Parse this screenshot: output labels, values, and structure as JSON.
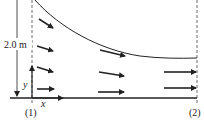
{
  "diagram": {
    "type": "fluid-flow-channel",
    "dimension_label": "2.0 m",
    "axis_labels": {
      "x": "x",
      "y": "y"
    },
    "section_labels": {
      "inlet": "(1)",
      "outlet": "(2)"
    },
    "colors": {
      "stroke": "#222222",
      "background": "#ffffff"
    },
    "velocity_arrows": {
      "inlet_column": 4,
      "middle_column": 3,
      "outlet_column": 2
    }
  }
}
